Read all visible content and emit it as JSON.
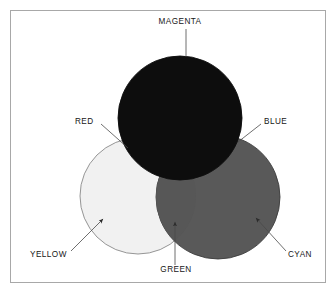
{
  "figure": {
    "background_color": "#ffffff",
    "frame": {
      "name": "outer-border",
      "x": 10,
      "y": 10,
      "width": 316,
      "height": 273,
      "stroke_color": "#a8a8a8",
      "fill_color": "#ffffff"
    }
  },
  "circles": [
    {
      "id": "magenta",
      "label": "MAGENTA",
      "cx": 180,
      "cy": 118,
      "r": 62,
      "fill_color": "#0d0d0d",
      "stroke_color": "#0d0d0d"
    },
    {
      "id": "yellow",
      "label": "YELLOW",
      "cx": 138,
      "cy": 196,
      "r": 58,
      "fill_color": "#f1f1f1",
      "stroke_color": "#8a8a8a"
    },
    {
      "id": "cyan",
      "label": "CYAN",
      "cx": 218,
      "cy": 197,
      "r": 62,
      "fill_color": "#595959",
      "stroke_color": "#3c3c3c"
    }
  ],
  "overlaps": [
    {
      "id": "red",
      "label": "RED",
      "of": "magenta + yellow",
      "fill_color": "#0d0d0d"
    },
    {
      "id": "blue",
      "label": "BLUE",
      "of": "magenta + cyan",
      "fill_color": "#0d0d0d"
    },
    {
      "id": "green",
      "label": "GREEN",
      "of": "yellow + cyan",
      "fill_color": "#575757"
    }
  ],
  "labels": {
    "magenta": {
      "text": "MAGENTA",
      "x": 180,
      "y": 24,
      "anchor": "middle"
    },
    "red": {
      "text": "RED",
      "x": 75,
      "y": 124,
      "anchor": "start"
    },
    "blue": {
      "text": "BLUE",
      "x": 264,
      "y": 124,
      "anchor": "start"
    },
    "yellow": {
      "text": "YELLOW",
      "x": 30,
      "y": 257,
      "anchor": "start"
    },
    "green": {
      "text": "GREEN",
      "x": 176,
      "y": 272,
      "anchor": "middle"
    },
    "cyan": {
      "text": "CYAN",
      "x": 288,
      "y": 257,
      "anchor": "start"
    }
  },
  "leaders": {
    "magenta": {
      "x1": 186,
      "y1": 29,
      "x2": 186,
      "y2": 57,
      "arrow": false
    },
    "red": {
      "x1": 101,
      "y1": 124,
      "x2": 128,
      "y2": 148,
      "arrow": false
    },
    "blue": {
      "x1": 261,
      "y1": 124,
      "x2": 238,
      "y2": 142,
      "arrow": false
    },
    "yellow": {
      "x1": 71,
      "y1": 251,
      "x2": 103,
      "y2": 219,
      "arrow": true
    },
    "green": {
      "x1": 175,
      "y1": 265,
      "x2": 175,
      "y2": 222,
      "arrow": true
    },
    "cyan": {
      "x1": 286,
      "y1": 251,
      "x2": 256,
      "y2": 218,
      "arrow": true
    }
  },
  "style": {
    "leader_stroke_color": "#4a4a4a",
    "leader_stroke_width": 0.8,
    "label_text_color": "#161616",
    "label_font_size": "8.2px"
  }
}
